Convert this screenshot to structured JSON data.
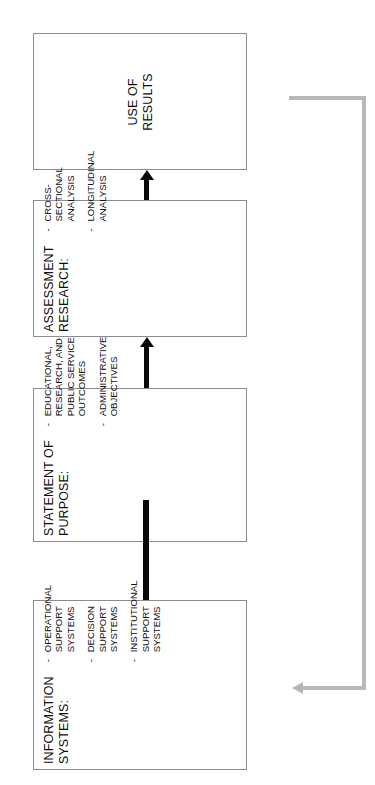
{
  "diagram": {
    "orientation": "rotated-90",
    "nodes": [
      {
        "id": "use-of-results",
        "title": "USE OF\nRESULTS",
        "title_lines": [
          "USE OF",
          "RESULTS"
        ],
        "bullets": []
      },
      {
        "id": "assessment-research",
        "title": "ASSESSMENT\nRESEARCH:",
        "title_lines": [
          "ASSESSMENT",
          "RESEARCH:"
        ],
        "bullets": [
          {
            "dash": "-",
            "lines": [
              "CROSS-",
              "SECTIONAL",
              "ANALYSIS"
            ]
          },
          {
            "dash": "-",
            "lines": [
              "LONGITUDINAL",
              "ANALYSIS"
            ]
          }
        ]
      },
      {
        "id": "statement-of-purpose",
        "title": "STATEMENT OF\nPURPOSE:",
        "title_lines": [
          "STATEMENT OF",
          "PURPOSE:"
        ],
        "bullets": [
          {
            "dash": "-",
            "lines": [
              "EDUCATIONAL,",
              "RESEARCH, AND",
              "PUBLIC SERVICE",
              "OUTCOMES"
            ]
          },
          {
            "dash": "-",
            "lines": [
              "ADMINISTRATIVE",
              "OBJECTIVES"
            ]
          }
        ]
      },
      {
        "id": "information-systems",
        "title": "INFORMATION\nSYSTEMS:",
        "title_lines": [
          "INFORMATION",
          "SYSTEMS:"
        ],
        "bullets": [
          {
            "dash": "-",
            "lines": [
              "OPERATIONAL",
              "SUPPORT",
              "SYSTEMS"
            ]
          },
          {
            "dash": "-",
            "lines": [
              "DECISION",
              "SUPPORT",
              "SYSTEMS"
            ]
          },
          {
            "dash": "-",
            "lines": [
              "INSTITUTIONAL",
              "SUPPORT",
              "SYSTEMS"
            ]
          }
        ]
      }
    ],
    "connectors": [
      {
        "id": "arrow-assessment-to-use",
        "from": "assessment-research",
        "to": "use-of-results",
        "style": "solid-black-arrow"
      },
      {
        "id": "arrow-purpose-to-assessment",
        "from": "statement-of-purpose",
        "to": "assessment-research",
        "style": "solid-black-arrow"
      },
      {
        "id": "arrow-systems-to-purpose",
        "from": "information-systems",
        "to": "statement-of-purpose",
        "style": "solid-black-arrow"
      },
      {
        "id": "feedback-use-to-systems",
        "from": "use-of-results",
        "to": "information-systems",
        "style": "gray-feedback-arrow"
      }
    ],
    "colors": {
      "box_border": "#8c8c8c",
      "text": "#111111",
      "arrow": "#0a0a0a",
      "feedback_arrow": "#b8b8b8",
      "background": "#ffffff"
    }
  }
}
